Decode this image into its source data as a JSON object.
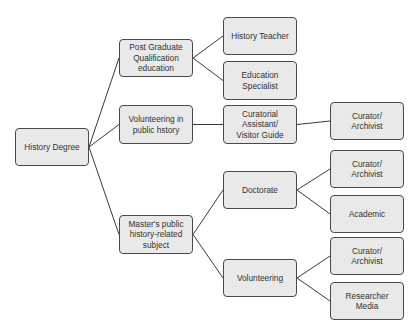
{
  "diagram": {
    "type": "tree",
    "colors": {
      "node_fill": "#e9e9e9",
      "node_border": "#4a4a4a",
      "edge": "#3a3a3a",
      "text": "#333333"
    },
    "nodes": [
      {
        "id": "root",
        "label": "History Degree",
        "x": 15,
        "y": 128,
        "w": 74,
        "h": 38
      },
      {
        "id": "pg",
        "label": "Post Graduate\nQualification\neducation",
        "x": 119,
        "y": 39,
        "w": 74,
        "h": 38
      },
      {
        "id": "vph",
        "label": "Volunteering in\npublic hstory",
        "x": 119,
        "y": 105,
        "w": 74,
        "h": 39
      },
      {
        "id": "ms",
        "label": "Master's public\nhistory-related\nsubject",
        "x": 119,
        "y": 215,
        "w": 74,
        "h": 39
      },
      {
        "id": "ht",
        "label": "History Teacher",
        "x": 223,
        "y": 17,
        "w": 74,
        "h": 38
      },
      {
        "id": "es",
        "label": "Education\nSpecialist",
        "x": 223,
        "y": 61,
        "w": 74,
        "h": 39
      },
      {
        "id": "ca",
        "label": "Curatorial\nAssistant/\nVisitor Guide",
        "x": 223,
        "y": 105,
        "w": 74,
        "h": 39
      },
      {
        "id": "cur1",
        "label": "Curator/\nArchivist",
        "x": 330,
        "y": 102,
        "w": 74,
        "h": 38
      },
      {
        "id": "doc",
        "label": "Doctorate",
        "x": 223,
        "y": 171,
        "w": 74,
        "h": 38
      },
      {
        "id": "vol",
        "label": "Volunteering",
        "x": 223,
        "y": 259,
        "w": 74,
        "h": 38
      },
      {
        "id": "cur2",
        "label": "Curator/\nArchivist",
        "x": 330,
        "y": 150,
        "w": 74,
        "h": 38
      },
      {
        "id": "acad",
        "label": "Academic",
        "x": 330,
        "y": 195,
        "w": 74,
        "h": 38
      },
      {
        "id": "cur3",
        "label": "Curator/\nArchivist",
        "x": 330,
        "y": 237,
        "w": 74,
        "h": 38
      },
      {
        "id": "res",
        "label": "Researcher\nMedia",
        "x": 330,
        "y": 282,
        "w": 74,
        "h": 38
      }
    ],
    "edges": [
      [
        "root",
        "pg"
      ],
      [
        "root",
        "vph"
      ],
      [
        "root",
        "ms"
      ],
      [
        "pg",
        "ht"
      ],
      [
        "pg",
        "es"
      ],
      [
        "vph",
        "ca"
      ],
      [
        "ca",
        "cur1"
      ],
      [
        "ms",
        "doc"
      ],
      [
        "ms",
        "vol"
      ],
      [
        "doc",
        "cur2"
      ],
      [
        "doc",
        "acad"
      ],
      [
        "vol",
        "cur3"
      ],
      [
        "vol",
        "res"
      ]
    ]
  }
}
